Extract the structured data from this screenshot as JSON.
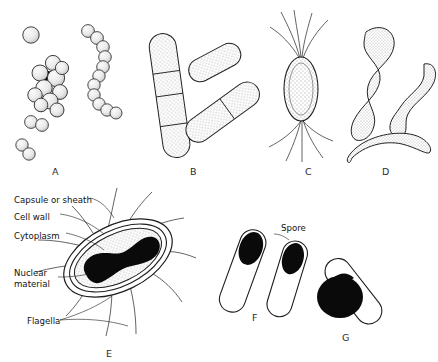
{
  "figure": {
    "background_color": "#ffffff",
    "ink_color": "#1a1a1a",
    "panel_captions": [
      {
        "key": "A",
        "label": "A",
        "x": 52,
        "y": 166,
        "subject": "cocci: single coccus, staphylococcus cluster, streptococcus chain, diplococci"
      },
      {
        "key": "B",
        "label": "B",
        "x": 190,
        "y": 166,
        "subject": "bacilli: rod-shaped cells with cross septa"
      },
      {
        "key": "C",
        "label": "C",
        "x": 305,
        "y": 166,
        "subject": "rod with polar flagella tufts"
      },
      {
        "key": "D",
        "label": "D",
        "x": 382,
        "y": 166,
        "subject": "spirilla: curved and spiral cells"
      },
      {
        "key": "E",
        "label": "E",
        "x": 106,
        "y": 348,
        "subject": "labelled bacterial cell structure"
      },
      {
        "key": "F",
        "label": "F",
        "x": 252,
        "y": 312,
        "subject": "cells with terminal spores"
      },
      {
        "key": "G",
        "label": "G",
        "x": 342,
        "y": 332,
        "subject": "cell with swollen terminal spore"
      }
    ],
    "structure_labels": [
      {
        "name": "capsule",
        "text": "Capsule or sheath",
        "x": 14,
        "y": 200
      },
      {
        "name": "cell-wall",
        "text": "Cell wall",
        "x": 14,
        "y": 216
      },
      {
        "name": "cytoplasm",
        "text": "Cytoplasm",
        "x": 14,
        "y": 235
      },
      {
        "name": "nuclear-material",
        "text": "Nuclear\nmaterial",
        "x": 14,
        "y": 272
      },
      {
        "name": "flagella",
        "text": "Flagella",
        "x": 27,
        "y": 321
      }
    ],
    "spore_label": {
      "name": "spore",
      "text": "Spore",
      "x": 281,
      "y": 228
    }
  }
}
